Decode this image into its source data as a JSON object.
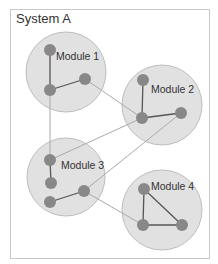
{
  "system": {
    "title": "System A",
    "frame": {
      "x": 10,
      "y": 9,
      "width": 199,
      "height": 249,
      "stroke": "#c8c8c8",
      "fill": "#ffffff"
    }
  },
  "style": {
    "module_fill": "#e1e1e1",
    "module_stroke": "#bdbdbd",
    "node_fill": "#888888",
    "intra_edge": "#555555",
    "inter_edge": "#aaaaaa",
    "label_color": "#333333"
  },
  "modules": [
    {
      "id": "m1",
      "label": "Module 1",
      "cx": 66,
      "cy": 72,
      "r": 40,
      "label_x": 56,
      "label_y": 60,
      "nodes": [
        {
          "id": "n1a",
          "x": 50,
          "y": 50
        },
        {
          "id": "n1b",
          "x": 50,
          "y": 90
        },
        {
          "id": "n1c",
          "x": 85,
          "y": 79
        }
      ]
    },
    {
      "id": "m2",
      "label": "Module 2",
      "cx": 162,
      "cy": 105,
      "r": 40,
      "label_x": 151,
      "label_y": 93,
      "nodes": [
        {
          "id": "n2a",
          "x": 143,
          "y": 80
        },
        {
          "id": "n2b",
          "x": 142,
          "y": 118
        },
        {
          "id": "n2c",
          "x": 181,
          "y": 113
        }
      ]
    },
    {
      "id": "m3",
      "label": "Module 3",
      "cx": 66,
      "cy": 177,
      "r": 39,
      "label_x": 61,
      "label_y": 169,
      "nodes": [
        {
          "id": "n3a",
          "x": 50,
          "y": 160
        },
        {
          "id": "n3b",
          "x": 51,
          "y": 183
        },
        {
          "id": "n3c",
          "x": 50,
          "y": 202
        },
        {
          "id": "n3d",
          "x": 84,
          "y": 191
        }
      ]
    },
    {
      "id": "m4",
      "label": "Module 4",
      "cx": 162,
      "cy": 210,
      "r": 40,
      "label_x": 151,
      "label_y": 190,
      "nodes": [
        {
          "id": "n4a",
          "x": 144,
          "y": 189
        },
        {
          "id": "n4b",
          "x": 143,
          "y": 225
        },
        {
          "id": "n4c",
          "x": 182,
          "y": 225
        }
      ]
    }
  ],
  "intra_edges": [
    [
      "n1a",
      "n1b"
    ],
    [
      "n1b",
      "n1c"
    ],
    [
      "n2a",
      "n2b"
    ],
    [
      "n2b",
      "n2c"
    ],
    [
      "n3a",
      "n3b"
    ],
    [
      "n3c",
      "n3d"
    ],
    [
      "n4a",
      "n4b"
    ],
    [
      "n4b",
      "n4c"
    ],
    [
      "n4a",
      "n4c"
    ]
  ],
  "inter_edges": [
    [
      "n1b",
      "n3a"
    ],
    [
      "n1c",
      "n2b"
    ],
    [
      "n3a",
      "n2b"
    ],
    [
      "n3d",
      "n2c"
    ],
    [
      "n3d",
      "n4b"
    ]
  ]
}
